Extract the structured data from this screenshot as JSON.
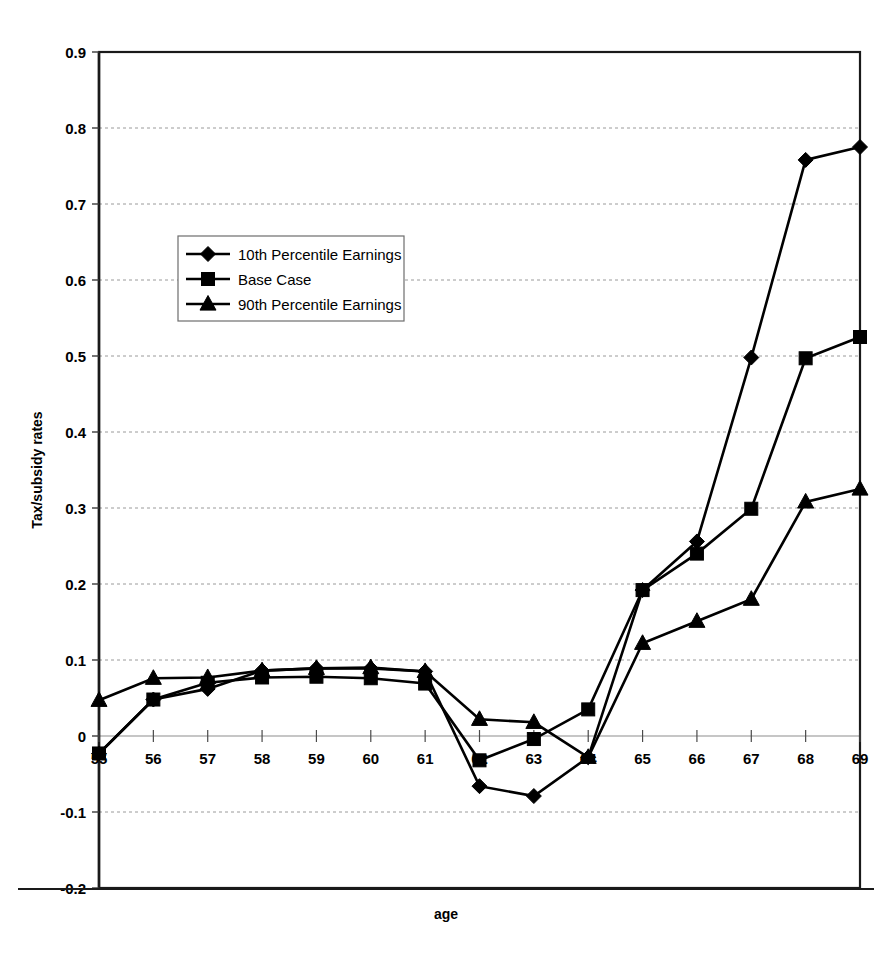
{
  "chart_data": {
    "type": "line",
    "title": "",
    "xlabel": "age",
    "ylabel": "Tax/subsidy rates",
    "categories": [
      55,
      56,
      57,
      58,
      59,
      60,
      61,
      62,
      63,
      64,
      65,
      66,
      67,
      68,
      69
    ],
    "x": [
      55,
      56,
      57,
      58,
      59,
      60,
      61,
      62,
      63,
      64,
      65,
      66,
      67,
      68,
      69
    ],
    "xlim": [
      55,
      69
    ],
    "ylim": [
      -0.2,
      0.9
    ],
    "y_ticks": [
      -0.2,
      -0.1,
      0,
      0.1,
      0.2,
      0.3,
      0.4,
      0.5,
      0.6,
      0.7,
      0.8,
      0.9
    ],
    "y_tick_labels": [
      "-0.2",
      "-0.1",
      "0",
      "0.1",
      "0.2",
      "0.3",
      "0.4",
      "0.5",
      "0.6",
      "0.7",
      "0.8",
      "0.9"
    ],
    "x_tick_labels": [
      "55",
      "56",
      "57",
      "58",
      "59",
      "60",
      "61",
      "62",
      "63",
      "64",
      "65",
      "66",
      "67",
      "68",
      "69"
    ],
    "grid": "horizontal-dotted",
    "legend_position": "upper-left-inside",
    "series": [
      {
        "name": "10th Percentile Earnings",
        "marker": "diamond",
        "values": [
          -0.023,
          0.048,
          0.062,
          0.086,
          0.089,
          0.089,
          0.085,
          -0.066,
          -0.079,
          -0.028,
          0.192,
          0.256,
          0.498,
          0.758,
          0.775
        ]
      },
      {
        "name": "Base Case",
        "marker": "square",
        "values": [
          -0.023,
          0.048,
          0.07,
          0.077,
          0.078,
          0.076,
          0.069,
          -0.032,
          -0.004,
          0.035,
          0.192,
          0.24,
          0.299,
          0.497,
          0.525
        ]
      },
      {
        "name": "90th Percentile Earnings",
        "marker": "triangle",
        "values": [
          0.047,
          0.076,
          0.077,
          0.086,
          0.089,
          0.09,
          0.085,
          0.022,
          0.018,
          -0.028,
          0.122,
          0.151,
          0.18,
          0.308,
          0.325
        ]
      }
    ]
  },
  "legend": {
    "entries": [
      {
        "label": "10th Percentile Earnings"
      },
      {
        "label": "Base Case"
      },
      {
        "label": "90th Percentile Earnings"
      }
    ]
  },
  "axes": {
    "y_title": "Tax/subsidy rates",
    "x_title": "age"
  },
  "colors": {
    "series": "#000000",
    "grid": "#9a9a9a",
    "border": "#1a1a1a",
    "background": "#ffffff"
  }
}
